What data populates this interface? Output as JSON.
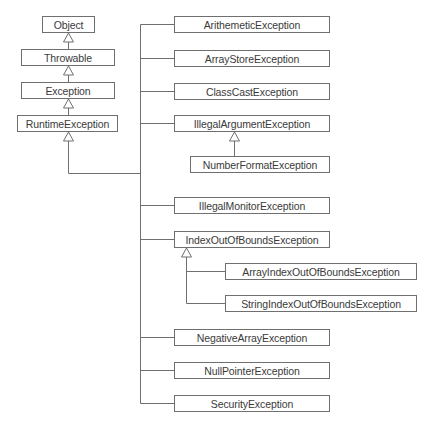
{
  "diagram": {
    "line_color": "#6f6f6f",
    "ancestors": [
      {
        "label": "Object",
        "x": 42,
        "y": 16,
        "w": 53,
        "h": 17
      },
      {
        "label": "Throwable",
        "x": 21,
        "y": 49,
        "w": 94,
        "h": 17
      },
      {
        "label": "Exception",
        "x": 21,
        "y": 82,
        "w": 94,
        "h": 17
      },
      {
        "label": "RuntimeException",
        "x": 17,
        "y": 115,
        "w": 101,
        "h": 17
      }
    ],
    "subclasses": [
      {
        "label": "ArithemeticException",
        "x": 174,
        "y": 16,
        "w": 156,
        "h": 17
      },
      {
        "label": "ArrayStoreException",
        "x": 174,
        "y": 50,
        "w": 156,
        "h": 17
      },
      {
        "label": "ClassCastException",
        "x": 174,
        "y": 83,
        "w": 156,
        "h": 17
      },
      {
        "label": "IllegalArgumentException",
        "x": 174,
        "y": 115,
        "w": 156,
        "h": 17
      },
      {
        "label": "NumberFormatException",
        "x": 190,
        "y": 156,
        "w": 140,
        "h": 17
      },
      {
        "label": "IllegalMonitorException",
        "x": 174,
        "y": 197,
        "w": 156,
        "h": 17
      },
      {
        "label": "IndexOutOfBoundsException",
        "x": 174,
        "y": 231,
        "w": 156,
        "h": 17
      },
      {
        "label": "ArrayIndexOutOfBoundsException",
        "x": 225,
        "y": 263,
        "w": 192,
        "h": 17
      },
      {
        "label": "StringIndexOutOfBoundsException",
        "x": 225,
        "y": 295,
        "w": 192,
        "h": 17
      },
      {
        "label": "NegativeArrayException",
        "x": 174,
        "y": 329,
        "w": 156,
        "h": 17
      },
      {
        "label": "NullPointerException",
        "x": 174,
        "y": 362,
        "w": 156,
        "h": 17
      },
      {
        "label": "SecurityException",
        "x": 174,
        "y": 395,
        "w": 156,
        "h": 17
      }
    ]
  }
}
